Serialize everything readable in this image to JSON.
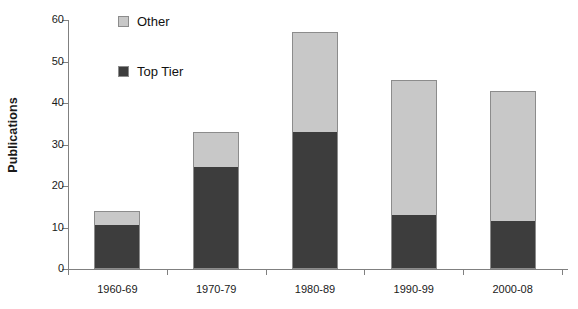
{
  "chart_data": {
    "type": "bar",
    "subtype": "stacked-bar",
    "title": "",
    "xlabel": "",
    "ylabel": "Publications",
    "categories": [
      "1960-69",
      "1970-79",
      "1980-89",
      "1990-99",
      "2000-08"
    ],
    "series": [
      {
        "name": "Top Tier",
        "color": "#3d3d3d",
        "values": [
          10.5,
          24.5,
          33,
          13,
          11.5
        ]
      },
      {
        "name": "Other",
        "color": "#c8c8c8",
        "values": [
          3.5,
          8.5,
          24,
          32.5,
          31.5
        ]
      }
    ],
    "totals": [
      14,
      33,
      57,
      45.5,
      43
    ],
    "ylim": [
      0,
      60
    ],
    "yticks": [
      0,
      10,
      20,
      30,
      40,
      50,
      60
    ],
    "ytick_labels": [
      "0",
      "10",
      "20",
      "30",
      "40",
      "50",
      "60"
    ],
    "grid": false,
    "legend_position": "inside-top-left",
    "stack_order": [
      "Top Tier",
      "Other"
    ]
  },
  "axes": {
    "y_title": "Publications",
    "tick_color": "#808080",
    "text_color": "#1a1a1a"
  },
  "legend": {
    "items": [
      {
        "label": "Other",
        "color": "#c8c8c8"
      },
      {
        "label": "Top Tier",
        "color": "#3d3d3d"
      }
    ]
  },
  "colors": {
    "top_tier": "#3d3d3d",
    "other": "#c8c8c8",
    "bar_border": "#8c8c8c",
    "axis": "#808080",
    "background": "#ffffff"
  }
}
